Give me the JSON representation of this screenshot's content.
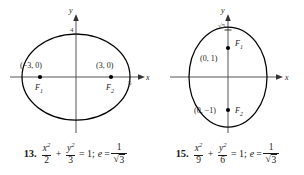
{
  "problems": [
    {
      "number": "13.",
      "figure": {
        "axis_x_label": "x",
        "axis_y_label": "y",
        "tick_top_label": "4",
        "tick_right_label": "5",
        "orientation": "horizontal-major",
        "points": [
          {
            "label": "(−3, 0)",
            "focus": "F",
            "focus_sub": "1"
          },
          {
            "label": "(3, 0)",
            "focus": "F",
            "focus_sub": "2"
          }
        ]
      },
      "equation": {
        "term1_num": "x",
        "term1_sup": "2",
        "term1_den": "2",
        "plus": "+",
        "term2_num": "y",
        "term2_sup": "2",
        "term2_den": "3",
        "equals": "= 1;",
        "ecc_symbol": "e",
        "ecc_equals": "=",
        "ecc_num": "1",
        "ecc_den_radical": "√",
        "ecc_den_value": "3"
      }
    },
    {
      "number": "15.",
      "figure": {
        "axis_x_label": "x",
        "axis_y_label": "y",
        "tick_top_label": "√5",
        "orientation": "vertical-major",
        "points": [
          {
            "label": "(0, 1)",
            "focus": "F",
            "focus_sub": "1"
          },
          {
            "label": "(0, −1)",
            "focus": "F",
            "focus_sub": "2"
          }
        ]
      },
      "equation": {
        "term1_num": "x",
        "term1_sup": "2",
        "term1_den": "9",
        "plus": "+",
        "term2_num": "y",
        "term2_sup": "2",
        "term2_den": "6",
        "equals": "= 1;",
        "ecc_symbol": "e",
        "ecc_equals": "=",
        "ecc_num": "1",
        "ecc_den_radical": "√",
        "ecc_den_value": "3"
      }
    }
  ],
  "colors": {
    "ink": "#1a1a1a",
    "curve": "#000000",
    "axis": "#555555"
  }
}
